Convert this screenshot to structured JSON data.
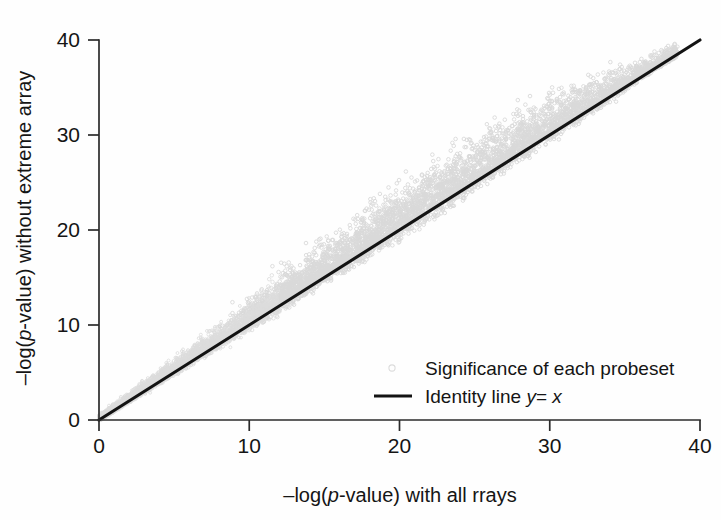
{
  "chart_data": {
    "type": "scatter",
    "title": "",
    "xlabel": "-log(p-value) with all rrays",
    "xlabel_parts": {
      "pre": "–log(",
      "italic": "p",
      "post": "-value) with all rrays"
    },
    "ylabel": "-log(p-value) without extreme array",
    "ylabel_parts": {
      "pre": "–log(",
      "italic": "p",
      "post": "-value) without extreme array"
    },
    "xlim": [
      0,
      40
    ],
    "ylim": [
      0,
      40
    ],
    "xticks": [
      "0",
      "10",
      "20",
      "30",
      "40"
    ],
    "yticks": [
      "0",
      "10",
      "20",
      "30",
      "40"
    ],
    "xtick_values": [
      0,
      10,
      20,
      30,
      40
    ],
    "ytick_values": [
      0,
      10,
      20,
      30,
      40
    ],
    "grid": false,
    "legend_position": "lower-right-inside",
    "series": [
      {
        "name": "Significance of each probeset",
        "type": "scatter",
        "marker": "open-circle",
        "color": "#d9d9d9",
        "n_points_approx": 22000,
        "description": "Dense cloud hugging the identity line, skewed above it; spread widens with x then narrows near x=38; no points beyond x~38.5",
        "x_range": [
          0,
          38.5
        ],
        "y_range": [
          0,
          39.5
        ]
      },
      {
        "name": "Identity line y = x",
        "type": "line",
        "color": "#131313",
        "from": [
          0,
          0
        ],
        "to": [
          40,
          40
        ]
      }
    ],
    "legend": [
      {
        "label": "Significance of each probeset",
        "marker": "open-circle",
        "color": "#d9d9d9"
      },
      {
        "label_pre": "Identity line ",
        "label_italic_y": "y",
        "label_eq": "=",
        "label_italic_x": "x",
        "label": "Identity line y = x",
        "marker": "line",
        "color": "#131313"
      }
    ],
    "colors": {
      "point": "#d9d9d9",
      "line": "#131313",
      "axis": "#2b2b2b",
      "text": "#151515",
      "background": "#fefefe"
    }
  }
}
